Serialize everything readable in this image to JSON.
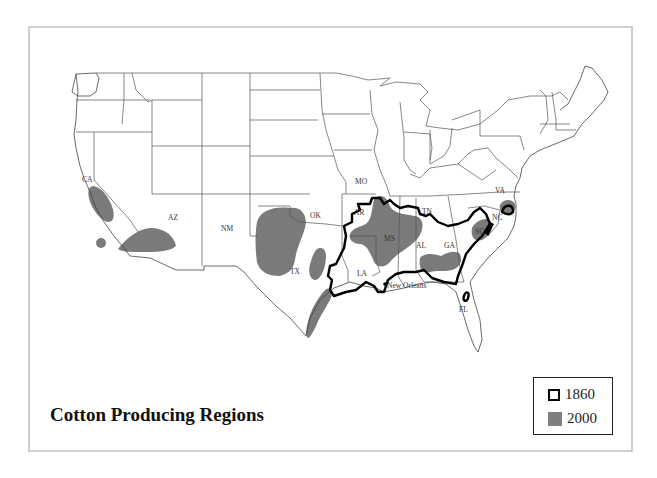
{
  "title": "Cotton Producing Regions",
  "legend": {
    "items": [
      {
        "label": "1860",
        "style": "outline",
        "color": "#000000"
      },
      {
        "label": "2000",
        "style": "fill",
        "color": "#7f7f7f"
      }
    ]
  },
  "state_labels": {
    "CA": "CA",
    "AZ": "AZ",
    "NM": "NM",
    "TX": "TX",
    "OK": "OK",
    "MO": "MO",
    "AR": "AR",
    "TN": "TN",
    "MS": "MS",
    "LA": "LA",
    "AL": "AL",
    "GA": "GA",
    "SC": "SC",
    "NC": "NC",
    "VA": "VA",
    "FL": "FL"
  },
  "city_labels": {
    "new_orleans": "New Orleans"
  },
  "colors": {
    "region_2000": "#7a7a7a",
    "region_1860_outline": "#000000",
    "state_borders": "#555555",
    "frame": "#cfcfcf"
  }
}
